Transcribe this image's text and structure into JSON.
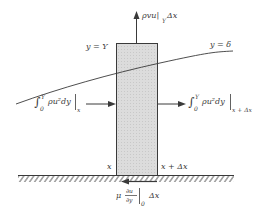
{
  "diagram": {
    "type": "boundary-layer control volume momentum balance",
    "colors": {
      "line": "#3a3a3a",
      "box_fill": "#d9d9d9",
      "background": "#ffffff"
    },
    "labels": {
      "top_flux": "ρvu|",
      "top_flux_sub": "Y",
      "top_flux_tail": "Δx",
      "y_eq_Y": "y = Y",
      "y_eq_delta": "y = δ",
      "left_flux_int": "∫",
      "left_flux_upper": "Y",
      "left_flux_lower": "0",
      "left_flux_body": "ρu²dy",
      "left_flux_eval": "x",
      "right_flux_int": "∫",
      "right_flux_upper": "Y",
      "right_flux_lower": "0",
      "right_flux_body": "ρu²dy",
      "right_flux_eval": "x + Δx",
      "x_left": "x",
      "x_right": "x + Δx",
      "shear_mu": "μ",
      "shear_num": "∂u",
      "shear_den": "∂y",
      "shear_eval": "0",
      "shear_tail": "Δx"
    }
  }
}
